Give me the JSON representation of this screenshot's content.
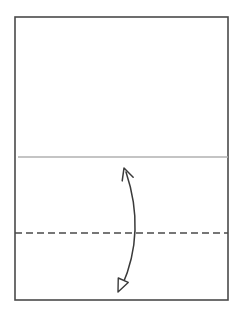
{
  "figure": {
    "canvas": {
      "width": 242,
      "height": 316,
      "background": "#ffffff"
    },
    "elements": {
      "sheet_outline": {
        "label": "sheet-outline",
        "shape": "rectangle",
        "x": 15,
        "y": 17,
        "width": 213,
        "height": 283,
        "stroke": "#4a4a4a",
        "stroke_width": 1.6,
        "fill": "none"
      },
      "upper_guide_line": {
        "label": "upper-guide-line",
        "shape": "horizontal-line",
        "y": 157,
        "x_start": 18,
        "x_end": 228,
        "stroke": "#b0b0b0",
        "stroke_width": 1.3,
        "style": "solid"
      },
      "fold_line": {
        "label": "fold-line",
        "shape": "horizontal-line",
        "y": 233,
        "x_start": 15,
        "x_end": 228,
        "stroke": "#4a4a4a",
        "stroke_width": 1.6,
        "style": "dashed",
        "dash_pattern": "7 4"
      },
      "curved_arrow": {
        "label": "curved-double-arrow",
        "shape": "quadratic-curve",
        "start_x": 126,
        "start_y": 172,
        "control_x": 146,
        "control_y": 232,
        "end_x": 122,
        "end_y": 286,
        "stroke": "#3a3a3a",
        "stroke_width": 1.5,
        "fill": "none"
      },
      "arrowhead_top": {
        "label": "arrowhead-top-open-v",
        "style": "open-v-stroke",
        "tip_x": 124,
        "tip_y": 168,
        "stroke": "#3a3a3a",
        "stroke_width": 1.5,
        "fill": "none"
      },
      "arrowhead_bottom": {
        "label": "arrowhead-bottom-hollow-triangle",
        "style": "hollow-triangle",
        "tip_x": 118,
        "tip_y": 292,
        "stroke": "#3a3a3a",
        "stroke_width": 1.4,
        "fill": "#ffffff"
      }
    }
  }
}
